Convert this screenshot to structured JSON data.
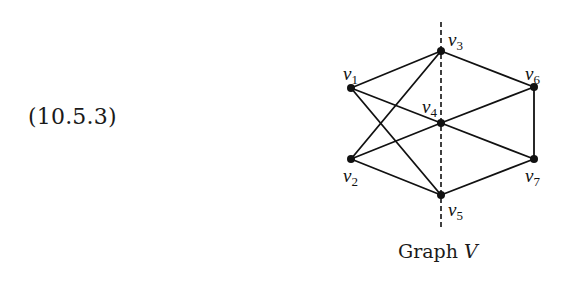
{
  "equation_label": "(10.5.3)",
  "caption": {
    "prefix": "Graph",
    "name": "V"
  },
  "graph": {
    "vertices": [
      {
        "id": "v1",
        "letter": "v",
        "sub": "1",
        "x": 351,
        "y": 88
      },
      {
        "id": "v2",
        "letter": "v",
        "sub": "2",
        "x": 351,
        "y": 159
      },
      {
        "id": "v3",
        "letter": "v",
        "sub": "3",
        "x": 441,
        "y": 51
      },
      {
        "id": "v4",
        "letter": "v",
        "sub": "4",
        "x": 441,
        "y": 123
      },
      {
        "id": "v5",
        "letter": "v",
        "sub": "5",
        "x": 441,
        "y": 195
      },
      {
        "id": "v6",
        "letter": "v",
        "sub": "6",
        "x": 534,
        "y": 87
      },
      {
        "id": "v7",
        "letter": "v",
        "sub": "7",
        "x": 534,
        "y": 159
      }
    ],
    "edges": [
      [
        "v1",
        "v3"
      ],
      [
        "v1",
        "v4"
      ],
      [
        "v1",
        "v5"
      ],
      [
        "v2",
        "v3"
      ],
      [
        "v2",
        "v4"
      ],
      [
        "v2",
        "v5"
      ],
      [
        "v3",
        "v6"
      ],
      [
        "v4",
        "v6"
      ],
      [
        "v4",
        "v7"
      ],
      [
        "v5",
        "v7"
      ],
      [
        "v6",
        "v7"
      ]
    ],
    "symmetry_axis": {
      "style": "dashed",
      "x": 441,
      "y_top": 22,
      "y_bottom": 229
    }
  }
}
